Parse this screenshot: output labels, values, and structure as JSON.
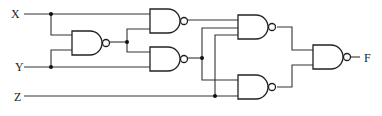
{
  "diagram": {
    "type": "logic-circuit",
    "gate_type": "NAND",
    "inputs": [
      {
        "label": "X"
      },
      {
        "label": "Y"
      },
      {
        "label": "Z"
      }
    ],
    "output": {
      "label": "F"
    },
    "gates": [
      {
        "id": "G1",
        "type": "NAND",
        "inputs": [
          "X",
          "Y"
        ]
      },
      {
        "id": "G2",
        "type": "NAND",
        "inputs": [
          "X",
          "G1"
        ]
      },
      {
        "id": "G3",
        "type": "NAND",
        "inputs": [
          "G1",
          "Y"
        ]
      },
      {
        "id": "G4",
        "type": "NAND",
        "inputs": [
          "G2",
          "G3",
          "Z"
        ]
      },
      {
        "id": "G5",
        "type": "NAND",
        "inputs": [
          "G3",
          "Z"
        ]
      },
      {
        "id": "G6",
        "type": "NAND",
        "inputs": [
          "G4",
          "G5"
        ],
        "output": "F"
      }
    ]
  }
}
